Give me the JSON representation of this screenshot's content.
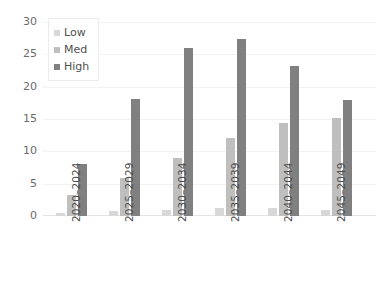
{
  "chart_data": {
    "type": "bar",
    "title": "",
    "subtitle": "",
    "xlabel": "",
    "ylabel": "",
    "ylim": [
      0,
      30
    ],
    "yticks": [
      0,
      5,
      10,
      15,
      20,
      25,
      30
    ],
    "ytick_labels": [
      "0",
      "5",
      "10",
      "15",
      "20",
      "25",
      "30"
    ],
    "grid": true,
    "grid_axis": "y",
    "legend_position": "top-left",
    "categories": [
      "2020–2024",
      "2025–2029",
      "2030–2034",
      "2035–2039",
      "2040–2044",
      "2045–2049"
    ],
    "series": [
      {
        "name": "Low",
        "color": "#d8d8d8",
        "values": [
          0.5,
          0.7,
          1.0,
          1.2,
          1.2,
          1.0
        ]
      },
      {
        "name": "Med",
        "color": "#bfbfbf",
        "values": [
          3.2,
          5.9,
          8.9,
          12.1,
          14.4,
          15.1
        ]
      },
      {
        "name": "High",
        "color": "#808080",
        "values": [
          8.1,
          18.1,
          26.0,
          27.3,
          23.2,
          17.9
        ]
      }
    ]
  },
  "legend": {
    "items": [
      {
        "label": "Low"
      },
      {
        "label": "Med"
      },
      {
        "label": "High"
      }
    ]
  }
}
